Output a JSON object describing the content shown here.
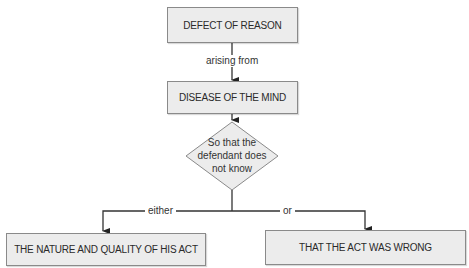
{
  "diagram": {
    "nodes": {
      "defect": "DEFECT OF REASON",
      "disease": "DISEASE OF THE MIND",
      "decision": [
        "So that the",
        "defendant does",
        "not know"
      ],
      "nature": "THE NATURE AND QUALITY OF HIS ACT",
      "wrong": "THAT THE ACT WAS WRONG"
    },
    "edges": {
      "arising": "arising from",
      "either": "either",
      "or": "or"
    },
    "colors": {
      "box_fill": "#ececec",
      "box_border": "#8a8a8a",
      "line": "#333333"
    }
  }
}
